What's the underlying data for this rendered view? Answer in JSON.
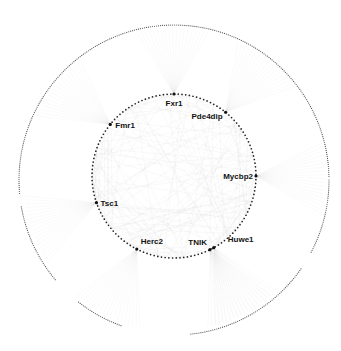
{
  "diagram": {
    "type": "circular-network",
    "inner_ring": {
      "center": [
        174,
        176
      ],
      "radius": 82,
      "dot_color": "#222222"
    },
    "outer_ring": {
      "center": [
        174,
        180
      ],
      "radius": 155,
      "dot_color": "#555555",
      "arcs_deg": [
        [
          175,
          359
        ],
        [
          0,
          28
        ],
        [
          35,
          84
        ],
        [
          110,
          128
        ],
        [
          140,
          170
        ]
      ]
    },
    "nodes": [
      {
        "id": "fxr1",
        "label": "Fxr1",
        "angle": 270,
        "label_dx": 0,
        "label_dy": 12,
        "anchor": "middle"
      },
      {
        "id": "pde4dip",
        "label": "Pde4dip",
        "angle": 309,
        "label_dx": -3,
        "label_dy": 7,
        "anchor": "end"
      },
      {
        "id": "fmr1",
        "label": "Fmr1",
        "angle": 219,
        "label_dx": 5,
        "label_dy": 4,
        "anchor": "start"
      },
      {
        "id": "mycbp2",
        "label": "Mycbp2",
        "angle": 0,
        "label_dx": -3,
        "label_dy": 3,
        "anchor": "end"
      },
      {
        "id": "tsc1",
        "label": "Tsc1",
        "angle": 161,
        "label_dx": 4,
        "label_dy": 3,
        "anchor": "start"
      },
      {
        "id": "herc2",
        "label": "Herc2",
        "angle": 117,
        "label_dx": 4,
        "label_dy": -5,
        "anchor": "start"
      },
      {
        "id": "tnik",
        "label": "TNIK",
        "angle": 64,
        "label_dx": -3,
        "label_dy": -5,
        "anchor": "end"
      },
      {
        "id": "huwe1",
        "label": "Huwe1",
        "angle": 61,
        "label_dx": 14,
        "label_dy": -6,
        "anchor": "start"
      }
    ],
    "colors": {
      "background": "#ffffff",
      "node": "#111111",
      "fan": "#9a9a9a",
      "edges": "#c8c8c8"
    }
  }
}
